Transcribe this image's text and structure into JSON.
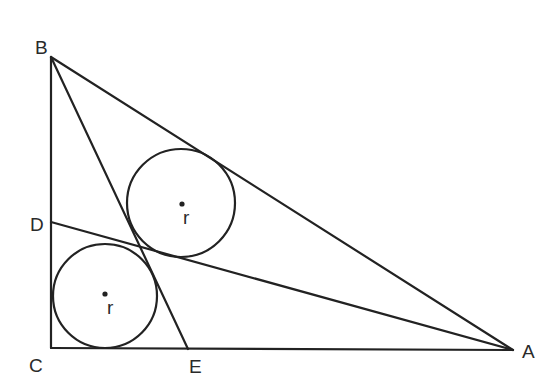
{
  "diagram": {
    "type": "geometry",
    "points": {
      "B": {
        "label": "B",
        "x": 51,
        "y": 57
      },
      "C": {
        "label": "C",
        "x": 51,
        "y": 348
      },
      "A": {
        "label": "A",
        "x": 513,
        "y": 350
      },
      "D": {
        "label": "D",
        "x": 51,
        "y": 222
      },
      "E": {
        "label": "E",
        "x": 188,
        "y": 349
      }
    },
    "segments": [
      {
        "from": "B",
        "to": "C"
      },
      {
        "from": "C",
        "to": "A"
      },
      {
        "from": "A",
        "to": "B"
      },
      {
        "from": "B",
        "to": "E"
      },
      {
        "from": "D",
        "to": "A"
      }
    ],
    "circles": [
      {
        "name": "upper-circle",
        "cx": 181,
        "cy": 203,
        "r": 54,
        "label": "r"
      },
      {
        "name": "lower-circle",
        "cx": 105,
        "cy": 296,
        "r": 52,
        "label": "r"
      }
    ],
    "labels": {
      "B": "B",
      "C": "C",
      "A": "A",
      "D": "D",
      "E": "E",
      "r_upper": "r",
      "r_lower": "r"
    },
    "colors": {
      "stroke": "#222222",
      "background": "#ffffff"
    }
  }
}
